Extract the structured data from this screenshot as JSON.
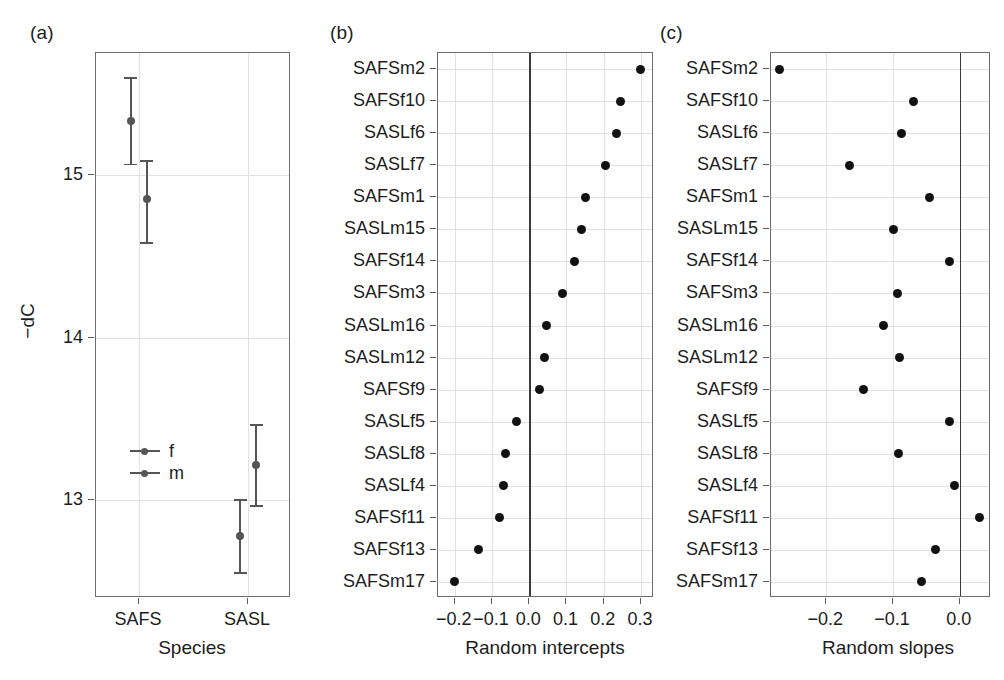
{
  "figure": {
    "panels": [
      {
        "tag": "(a)"
      },
      {
        "tag": "(b)"
      },
      {
        "tag": "(c)"
      }
    ]
  },
  "panel_a": {
    "tag": "(a)",
    "xlabel": "Species",
    "ylabel": "−dC",
    "y_ticks": [
      "15",
      "14",
      "13"
    ],
    "x_categories": [
      "SAFS",
      "SASL"
    ],
    "legend": [
      {
        "key": "f",
        "label": "f"
      },
      {
        "key": "m",
        "label": "m"
      }
    ]
  },
  "panel_b": {
    "tag": "(b)",
    "xlabel": "Random intercepts",
    "x_ticks": [
      "−0.2",
      "−0.1",
      "0.0",
      "0.1",
      "0.2",
      "0.3"
    ]
  },
  "panel_c": {
    "tag": "(c)",
    "xlabel": "Random slopes",
    "x_ticks": [
      "−0.2",
      "−0.1",
      "0.0"
    ]
  },
  "colors": {
    "dot": "#111111",
    "error_bar": "#555555",
    "grid": "#e2e2e2",
    "frame": "#6e6e6e",
    "zero_line": "#3a3a3a",
    "text": "#1d1d1d",
    "background": "#ffffff"
  },
  "chart_data": [
    {
      "type": "scatter",
      "panel": "a",
      "title": "(a)",
      "xlabel": "Species",
      "ylabel": "−dC",
      "ylim": [
        12.4,
        15.75
      ],
      "yticks": [
        15,
        14,
        13
      ],
      "grid": true,
      "legend": [
        "f",
        "m"
      ],
      "legend_position": "inside-lower-left",
      "x_categories": [
        "SAFS",
        "SASL"
      ],
      "series": [
        {
          "name": "f",
          "points": [
            {
              "x": "SAFS",
              "y": 15.33,
              "ci_low": 15.07,
              "ci_high": 15.6
            },
            {
              "x": "SASL",
              "y": 12.78,
              "ci_low": 12.56,
              "ci_high": 13.01
            }
          ]
        },
        {
          "name": "m",
          "points": [
            {
              "x": "SAFS",
              "y": 14.85,
              "ci_low": 14.59,
              "ci_high": 15.09
            },
            {
              "x": "SASL",
              "y": 13.22,
              "ci_low": 12.97,
              "ci_high": 13.47
            }
          ]
        }
      ]
    },
    {
      "type": "scatter",
      "panel": "b",
      "title": "(b)",
      "xlabel": "Random intercepts",
      "ylabel": "",
      "orientation": "horizontal",
      "xlim": [
        -0.245,
        0.335
      ],
      "xticks": [
        -0.2,
        -0.1,
        0.0,
        0.1,
        0.2,
        0.3
      ],
      "xticklabels": [
        "−0.2",
        "−0.1",
        "0.0",
        "0.1",
        "0.2",
        "0.3"
      ],
      "grid": true,
      "reference_line": 0.0,
      "categories": [
        "SAFSm2",
        "SAFSf10",
        "SASLf6",
        "SASLf7",
        "SAFSm1",
        "SASLm15",
        "SAFSf14",
        "SAFSm3",
        "SASLm16",
        "SASLm12",
        "SAFSf9",
        "SASLf5",
        "SASLf8",
        "SASLf4",
        "SAFSf11",
        "SAFSf13",
        "SAFSm17"
      ],
      "values": [
        0.3,
        0.244,
        0.234,
        0.206,
        0.15,
        0.139,
        0.122,
        0.089,
        0.047,
        0.04,
        0.028,
        -0.033,
        -0.064,
        -0.07,
        -0.08,
        -0.135,
        -0.2
      ]
    },
    {
      "type": "scatter",
      "panel": "c",
      "title": "(c)",
      "xlabel": "Random slopes",
      "ylabel": "",
      "orientation": "horizontal",
      "xlim": [
        -0.283,
        0.047
      ],
      "xticks": [
        -0.2,
        -0.1,
        0.0
      ],
      "xticklabels": [
        "−0.2",
        "−0.1",
        "0.0"
      ],
      "grid": true,
      "reference_line": 0.0,
      "categories": [
        "SAFSm2",
        "SAFSf10",
        "SASLf6",
        "SASLf7",
        "SAFSm1",
        "SASLm15",
        "SAFSf14",
        "SAFSm3",
        "SASLm16",
        "SASLm12",
        "SAFSf9",
        "SASLf5",
        "SASLf8",
        "SASLf4",
        "SAFSf11",
        "SAFSf13",
        "SAFSm17"
      ],
      "values": [
        -0.27,
        -0.07,
        -0.087,
        -0.166,
        -0.046,
        -0.1,
        -0.016,
        -0.093,
        -0.115,
        -0.09,
        -0.144,
        -0.015,
        -0.092,
        -0.008,
        0.029,
        -0.036,
        -0.057
      ]
    }
  ]
}
